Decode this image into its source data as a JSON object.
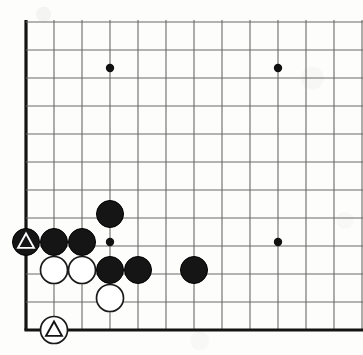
{
  "diagram": {
    "kind": "go-board-diagram",
    "board": {
      "cell_size": 28,
      "stone_radius": 13.5,
      "origin_x": 26,
      "origin_y": 330,
      "left_edge_x": 26,
      "bottom_edge_y": 330,
      "edge_line_width": 3.2,
      "grid_line_width": 1.1,
      "grid_color": "#6b6b6b",
      "edge_color": "#141414",
      "background_color": "#fdfdfb",
      "vertical_lines_x": [
        26,
        54,
        82,
        110,
        138,
        166,
        194,
        222,
        250,
        278,
        306,
        334,
        362
      ],
      "horizontal_lines_y": [
        330,
        302,
        274,
        246,
        218,
        190,
        162,
        134,
        106,
        78,
        50,
        22
      ],
      "grid_top_y": 20,
      "grid_right_x": 363
    },
    "star_points": [
      {
        "name": "star-point-1",
        "x": 110,
        "y": 68,
        "r": 4.2
      },
      {
        "name": "star-point-2",
        "x": 278,
        "y": 68,
        "r": 4.2
      },
      {
        "name": "star-point-3",
        "x": 278,
        "y": 242,
        "r": 4.2
      },
      {
        "name": "star-point-4",
        "x": 110,
        "y": 242,
        "r": 4.2
      }
    ],
    "colors": {
      "black_stone_fill": "#151515",
      "black_stone_edge": "#000000",
      "white_stone_fill": "#ffffff",
      "white_stone_edge": "#1a1a1a",
      "marker_stroke_on_black": "#ffffff",
      "marker_stroke_on_white": "#141414"
    },
    "stones": [
      {
        "name": "black-stone-marked-left-edge",
        "color": "black",
        "x": 26,
        "y": 242,
        "marker": "triangle"
      },
      {
        "name": "black-stone-b2",
        "color": "black",
        "x": 54,
        "y": 242,
        "marker": "none"
      },
      {
        "name": "black-stone-c2",
        "color": "black",
        "x": 82,
        "y": 242,
        "marker": "none"
      },
      {
        "name": "black-stone-d3",
        "color": "black",
        "x": 110,
        "y": 214,
        "marker": "none"
      },
      {
        "name": "white-stone-b1",
        "color": "white",
        "x": 54,
        "y": 270,
        "marker": "none"
      },
      {
        "name": "white-stone-c1",
        "color": "white",
        "x": 82,
        "y": 270,
        "marker": "none"
      },
      {
        "name": "black-stone-d1",
        "color": "black",
        "x": 110,
        "y": 270,
        "marker": "none"
      },
      {
        "name": "black-stone-e1",
        "color": "black",
        "x": 138,
        "y": 270,
        "marker": "none"
      },
      {
        "name": "black-stone-g1",
        "color": "black",
        "x": 194,
        "y": 270,
        "marker": "none"
      },
      {
        "name": "white-stone-d0",
        "color": "white",
        "x": 110,
        "y": 298,
        "marker": "none"
      },
      {
        "name": "white-stone-marked-bottom-edge",
        "color": "white",
        "x": 54,
        "y": 330,
        "marker": "triangle"
      }
    ],
    "counts": {
      "black_stones": "6",
      "white_stones": "5",
      "marked_stones": "2",
      "visible_star_points": "4"
    }
  }
}
